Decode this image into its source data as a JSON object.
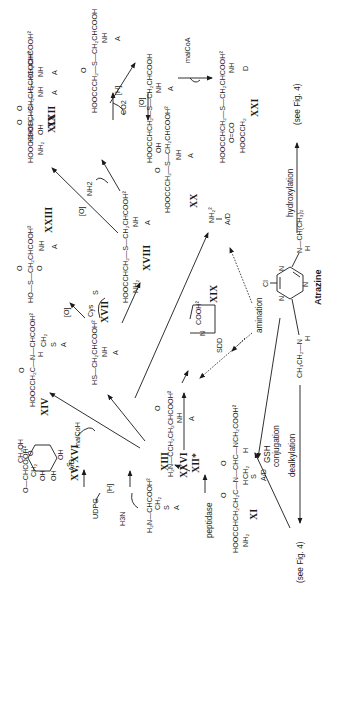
{
  "figure": {
    "orientation": "rotated-90-ccw",
    "central_compound": {
      "name": "Atrazine",
      "substituents": {
        "top": "Cl",
        "left": "CH3CH2—N—H",
        "right": "N—CH(CH3)2 / H"
      }
    },
    "processes": {
      "hydroxylation": "hydroxylation",
      "see_fig4_top": "(see Fig. 4)",
      "see_fig4_bottom": "(see Fig. 4)",
      "dealkylation": "dealkylation",
      "gsh_conjugation_1": "GSH",
      "gsh_conjugation_2": "conjugation",
      "amination": "amination",
      "peptidase": "peptidase"
    },
    "reagents": {
      "malCoA": "malCoA",
      "malCoH": "malCoH",
      "O_1": "[O]",
      "O_2": "[O]",
      "O_3": "[O]",
      "O_4": "[O]",
      "H_1": "[H]",
      "H_2": "[H]",
      "CO2": "CO2",
      "NH2": "NH2",
      "Cys": "Cys",
      "S": "S",
      "UDPG": "UDPG",
      "H3N": "H3N"
    },
    "compounds": [
      {
        "id": "XXII",
        "label": "XXII",
        "formula_lines": [
          "O",
          "HOOCCHCH2—S—CH2CHCOOH²",
          "OH",
          "NH",
          "A"
        ]
      },
      {
        "id": "XXI",
        "label": "XXI",
        "formula_lines": [
          "HOOCCHCH2—S—CH2CHCOOH²",
          "O=CO",
          "HOOCCH2",
          "NH",
          "D"
        ]
      },
      {
        "id": "center-top",
        "label": "",
        "formula_lines": [
          "HOOCCHCH2—S—CH2CHCOOH",
          "OH",
          "NH",
          "A"
        ]
      },
      {
        "id": "XX",
        "label": "XX",
        "formula_lines": [
          "O",
          "HOOCCCH2—S—CH2CHCOOH²",
          "NH",
          "A"
        ]
      },
      {
        "id": "XIX-pre",
        "label": "",
        "formula_lines": [
          "O",
          "HOOCCCH2—S—CH2CHCOOH",
          "NH",
          "A"
        ]
      },
      {
        "id": "XIX",
        "label": "XIX",
        "formula_lines": [
          "O",
          "HOOCCHCH2—S—CH2CHCOOH²",
          "NH2",
          "NH",
          "A"
        ]
      },
      {
        "id": "XXIII",
        "label": "XXIII",
        "formula_lines": [
          "O",
          "HO—S—CH2CHCOOH²",
          "O",
          "NH",
          "A"
        ]
      },
      {
        "id": "XVIII",
        "label": "XVIII",
        "formula_lines": [
          "HOOCCHCH2—S—CH2CHCOOH²",
          "NH2",
          "NH",
          "A"
        ]
      },
      {
        "id": "XXIV-XXV",
        "label": "XXIV, XXV",
        "formula_lines": [
          "NH2²",
          "A/D"
        ]
      },
      {
        "id": "XXVII",
        "label": "XXVII",
        "formula_lines": [
          "N",
          "COOH²",
          "SDD"
        ]
      },
      {
        "id": "XIV",
        "label": "XIV",
        "formula_lines": [
          "O",
          "HOOCCH2C—N—CHCOOH²",
          "H",
          "CH2",
          "S",
          "A"
        ]
      },
      {
        "id": "XVII",
        "label": "XVII",
        "formula_lines": [
          "HS—CH2CHCOOH²",
          "NH",
          "A"
        ]
      },
      {
        "id": "XXVI",
        "label": "XXVI",
        "formula_lines": [
          "O",
          "H2N—CCH2CH2CHCOOH²",
          "NH",
          "A"
        ]
      },
      {
        "id": "XV-XVI",
        "label": "XV, XVI",
        "formula_lines": [
          "CH2OH",
          "O—CHCOOH²",
          "CH2",
          "S",
          "A/D",
          "OH",
          "OH",
          "OH"
        ]
      },
      {
        "id": "XIII",
        "label": "XIII",
        "formula_lines": [
          "H2N—CHCOOH²",
          "CH2",
          "S",
          "A"
        ]
      },
      {
        "id": "XII",
        "label": "XII*",
        "formula_lines": []
      },
      {
        "id": "XI",
        "label": "XI",
        "formula_lines": [
          "O",
          "O",
          "HOOCCHCH2CH2C—N—CHC—NCH2COOH²",
          "NH2",
          "H",
          "CH2",
          "S",
          "A/D",
          "H"
        ]
      }
    ]
  }
}
